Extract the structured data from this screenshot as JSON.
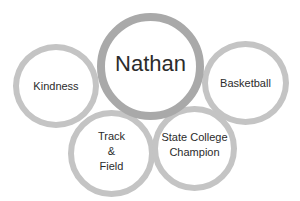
{
  "diagram": {
    "center": {
      "label": "Nathan"
    },
    "nodes": [
      {
        "label": "Kindness"
      },
      {
        "label": "Basketball"
      },
      {
        "label": "Track\n&\nField"
      },
      {
        "label": "State College\nChampion"
      }
    ]
  },
  "colors": {
    "center_ring": "#a9a9a9",
    "node_ring": "#c4c4c4",
    "text": "#2b2b2b"
  }
}
